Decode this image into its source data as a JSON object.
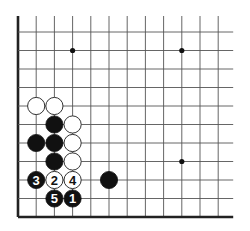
{
  "diagram": {
    "type": "go-board-fragment",
    "grid": {
      "columns": 12,
      "rows": 11,
      "origin_x": 18,
      "origin_y": 32,
      "spacing_x": 18.2,
      "spacing_y": 18.5,
      "left_edge": true,
      "bottom_edge": true,
      "extend_top": 16,
      "extend_right": 15,
      "line_color": "#555555",
      "edge_color": "#222222"
    },
    "star_points": [
      {
        "col": 3,
        "row": 1
      },
      {
        "col": 9,
        "row": 1
      },
      {
        "col": 9,
        "row": 7
      }
    ],
    "stones": [
      {
        "col": 1,
        "row": 4,
        "color": "white",
        "label": ""
      },
      {
        "col": 2,
        "row": 4,
        "color": "white",
        "label": ""
      },
      {
        "col": 2,
        "row": 5,
        "color": "black",
        "label": ""
      },
      {
        "col": 3,
        "row": 5,
        "color": "white",
        "label": ""
      },
      {
        "col": 1,
        "row": 6,
        "color": "black",
        "label": ""
      },
      {
        "col": 2,
        "row": 6,
        "color": "black",
        "label": ""
      },
      {
        "col": 3,
        "row": 6,
        "color": "white",
        "label": ""
      },
      {
        "col": 2,
        "row": 7,
        "color": "black",
        "label": ""
      },
      {
        "col": 3,
        "row": 7,
        "color": "white",
        "label": ""
      },
      {
        "col": 1,
        "row": 8,
        "color": "black",
        "label": "3"
      },
      {
        "col": 2,
        "row": 8,
        "color": "white",
        "label": "2"
      },
      {
        "col": 3,
        "row": 8,
        "color": "white",
        "label": "4"
      },
      {
        "col": 5,
        "row": 8,
        "color": "black",
        "label": ""
      },
      {
        "col": 2,
        "row": 9,
        "color": "black",
        "label": "5"
      },
      {
        "col": 3,
        "row": 9,
        "color": "black",
        "label": "1"
      }
    ]
  }
}
